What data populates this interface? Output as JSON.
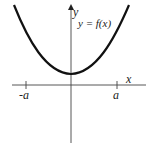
{
  "diagram": {
    "type": "function-graph",
    "curve_label": "y = f(x)",
    "x_axis_label": "x",
    "y_axis_label": "y",
    "x_ticks": [
      {
        "label": "-a",
        "value": -1
      },
      {
        "label": "a",
        "value": 1
      }
    ],
    "curve": {
      "shape": "upward parabola (even function)",
      "minimum_above_x_axis": true
    },
    "colors": {
      "curve": "#111111",
      "axes": "#444444",
      "background": "#ffffff"
    }
  }
}
